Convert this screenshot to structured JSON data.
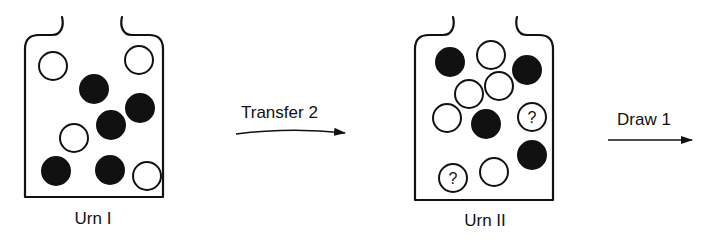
{
  "diagram": {
    "urns": [
      {
        "label": "Urn I",
        "outline": {
          "left": 25,
          "right": 163,
          "top": 35,
          "bottom": 197,
          "neck_left": 62,
          "neck_right": 122,
          "neck_top": 17
        },
        "label_pos": {
          "x": 93,
          "y": 209
        },
        "balls": [
          {
            "x": 53,
            "y": 66,
            "type": "white"
          },
          {
            "x": 139,
            "y": 60,
            "type": "white"
          },
          {
            "x": 94,
            "y": 89,
            "type": "black"
          },
          {
            "x": 140,
            "y": 108,
            "type": "black"
          },
          {
            "x": 111,
            "y": 125,
            "type": "black"
          },
          {
            "x": 74,
            "y": 138,
            "type": "white"
          },
          {
            "x": 56,
            "y": 171,
            "type": "black"
          },
          {
            "x": 110,
            "y": 170,
            "type": "black"
          },
          {
            "x": 147,
            "y": 176,
            "type": "white"
          }
        ]
      },
      {
        "label": "Urn II",
        "outline": {
          "left": 415,
          "right": 553,
          "top": 35,
          "bottom": 200,
          "neck_left": 453,
          "neck_right": 517,
          "neck_top": 17
        },
        "label_pos": {
          "x": 485,
          "y": 211
        },
        "balls": [
          {
            "x": 450,
            "y": 62,
            "type": "black"
          },
          {
            "x": 491,
            "y": 55,
            "type": "white"
          },
          {
            "x": 527,
            "y": 70,
            "type": "black"
          },
          {
            "x": 469,
            "y": 94,
            "type": "white"
          },
          {
            "x": 499,
            "y": 86,
            "type": "white"
          },
          {
            "x": 447,
            "y": 118,
            "type": "white"
          },
          {
            "x": 486,
            "y": 124,
            "type": "black"
          },
          {
            "x": 532,
            "y": 117,
            "type": "unknown",
            "mark": "?"
          },
          {
            "x": 532,
            "y": 155,
            "type": "black"
          },
          {
            "x": 453,
            "y": 178,
            "type": "unknown",
            "mark": "?"
          },
          {
            "x": 494,
            "y": 172,
            "type": "white"
          }
        ]
      }
    ],
    "arrows": [
      {
        "label": "Transfer 2",
        "x1": 236,
        "x2": 345,
        "y": 134,
        "curved": true,
        "label_pos": {
          "x": 241,
          "y": 103
        }
      },
      {
        "label": "Draw 1",
        "x1": 608,
        "x2": 692,
        "y": 140,
        "curved": false,
        "label_pos": {
          "x": 617,
          "y": 110
        }
      }
    ],
    "ball_radius": 14,
    "colors": {
      "ink": "#111111",
      "background": "#ffffff"
    }
  }
}
